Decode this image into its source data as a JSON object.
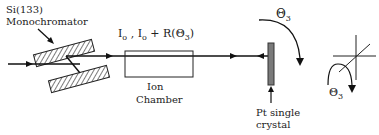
{
  "diagram": {
    "monochromator_label": [
      "Si(133)",
      "Monochromator"
    ],
    "intensity_label": {
      "i0": "I",
      "sub0": "o",
      "sep": " ,  I",
      "sub1": "o",
      "plus": " + R(",
      "theta": "Θ",
      "theta_sub": "3",
      "close": ")"
    },
    "ion_chamber_label": [
      "Ion",
      "Chamber"
    ],
    "crystal_label": [
      "Pt single",
      "crystal"
    ],
    "rotation_label": {
      "symbol": "Θ",
      "sub": "3"
    },
    "axes_rotation_label": {
      "symbol": "Θ",
      "sub": "3"
    }
  }
}
